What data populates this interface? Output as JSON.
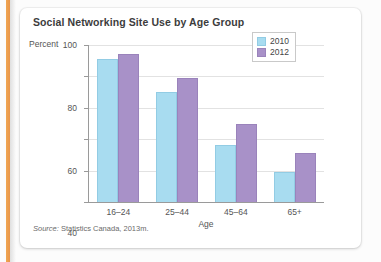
{
  "chart_data": {
    "type": "bar",
    "title": "Social Networking Site Use by Age Group",
    "xlabel": "Age",
    "ylabel": "Percent",
    "categories": [
      "16–24",
      "25–44",
      "45–64",
      "65+"
    ],
    "series": [
      {
        "name": "2010",
        "color": "#a8dcf0",
        "values": [
          91,
          70,
          36,
          19
        ]
      },
      {
        "name": "2012",
        "color": "#a891c8",
        "values": [
          94,
          79,
          50,
          31
        ]
      }
    ],
    "ylim": [
      0,
      100
    ],
    "yticks": [
      0,
      20,
      40,
      60,
      80,
      100
    ],
    "ytick_labels": [
      "0",
      "20",
      "40",
      "60",
      "80",
      "100"
    ],
    "grid": true,
    "legend_position": "top-right"
  },
  "source": {
    "prefix": "Source:",
    "text": " Statistics Canada, 2013m."
  },
  "colors": {
    "series_2010": "#a8dcf0",
    "series_2012": "#a891c8",
    "edge_strip": "#f0a651",
    "title_text": "#3c3c3c",
    "axis_text": "#555555"
  }
}
